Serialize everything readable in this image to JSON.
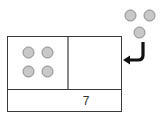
{
  "diagram": {
    "type": "part-whole bar model",
    "total_label": "7",
    "left_part": {
      "count": 4,
      "description": "4 counters"
    },
    "right_part": {
      "count": 0,
      "description": "empty box"
    },
    "incoming": {
      "count": 3,
      "description": "3 counters moving into right box"
    },
    "colors": {
      "counter_fill": "#c8c8c8",
      "counter_stroke": "#8a8a8a",
      "box_stroke": "#3a3a3a",
      "arrow": "#111111"
    }
  }
}
